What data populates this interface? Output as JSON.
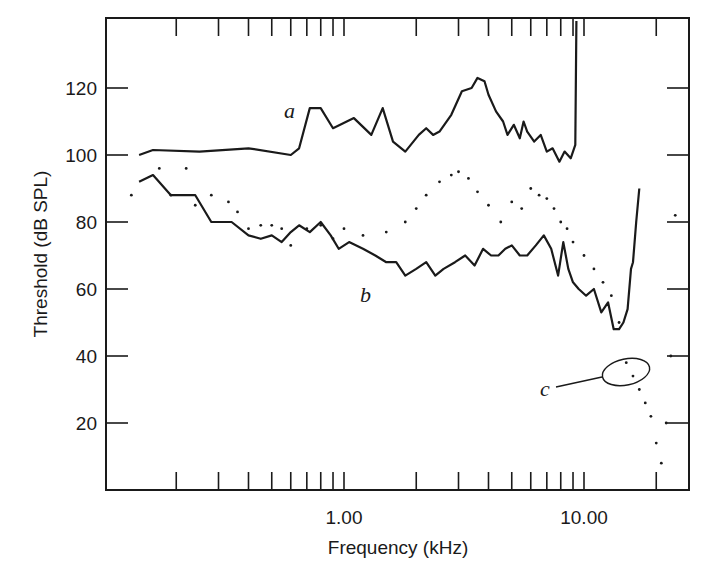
{
  "chart_data": {
    "type": "line",
    "title": "",
    "xlabel": "Frequency (kHz)",
    "ylabel": "Threshold (dB SPL)",
    "xscale": "log",
    "xlim": [
      0.12,
      28
    ],
    "ylim": [
      0,
      141
    ],
    "grid": false,
    "legend": "none (inline curve labels a, b, c)",
    "x_tick_labels": [
      {
        "value": 1.0,
        "label": "1.00"
      },
      {
        "value": 10.0,
        "label": "10.00"
      }
    ],
    "x_minor_ticks": [
      0.2,
      0.3,
      0.4,
      0.5,
      0.6,
      0.7,
      0.8,
      0.9,
      1.0,
      2,
      3,
      4,
      5,
      6,
      7,
      8,
      9,
      10,
      20
    ],
    "y_ticks": [
      20,
      40,
      60,
      80,
      100,
      120
    ],
    "y_tick_labels": [
      "20",
      "40",
      "60",
      "80",
      "100",
      "120"
    ],
    "annotations": [
      {
        "text": "a",
        "x": 0.6,
        "y": 112,
        "target": "series a (upper solid curve)"
      },
      {
        "text": "b",
        "x": 1.9,
        "y": 60,
        "target": "series b (lower solid curve)"
      },
      {
        "text": "c",
        "x": 11.5,
        "y": 28,
        "target": "dotted cluster, circled region near 15 kHz / 35 dB"
      }
    ],
    "series": [
      {
        "name": "a",
        "style": "solid",
        "x": [
          0.14,
          0.16,
          0.25,
          0.4,
          0.6,
          0.65,
          0.72,
          0.8,
          0.9,
          1.1,
          1.3,
          1.45,
          1.6,
          1.8,
          2.05,
          2.2,
          2.35,
          2.5,
          2.8,
          3.1,
          3.4,
          3.6,
          3.85,
          4.0,
          4.3,
          4.6,
          4.8,
          5.1,
          5.4,
          5.6,
          5.8,
          6.2,
          6.6,
          7.0,
          7.4,
          7.9,
          8.3,
          8.8,
          9.2,
          9.3,
          9.3
        ],
        "y": [
          100,
          101.5,
          101,
          102,
          100,
          102,
          114,
          114,
          108,
          111,
          106,
          114,
          104,
          101,
          106,
          108,
          106,
          107,
          112,
          119,
          120,
          123,
          122,
          118,
          113,
          110,
          106,
          109,
          105,
          110,
          107,
          104,
          106,
          101,
          102,
          98,
          101,
          99,
          103,
          140,
          140
        ]
      },
      {
        "name": "b",
        "style": "solid",
        "x": [
          0.14,
          0.16,
          0.19,
          0.24,
          0.28,
          0.34,
          0.4,
          0.45,
          0.5,
          0.55,
          0.6,
          0.65,
          0.72,
          0.8,
          0.88,
          0.95,
          1.05,
          1.2,
          1.35,
          1.5,
          1.65,
          1.8,
          2.0,
          2.2,
          2.4,
          2.6,
          2.9,
          3.2,
          3.5,
          3.8,
          4.1,
          4.4,
          4.7,
          5.0,
          5.4,
          5.8,
          6.3,
          6.8,
          7.3,
          7.8,
          8.2,
          8.6,
          9.0,
          9.5,
          10.2,
          11.0,
          11.8,
          12.6,
          13.3,
          14.0,
          14.6,
          15.2,
          15.7,
          16.0,
          16.5,
          17.0
        ],
        "y": [
          92,
          94,
          88,
          88,
          80,
          80,
          76,
          75,
          76,
          74,
          77,
          79,
          77,
          80,
          76,
          72,
          74,
          72,
          70,
          68,
          68,
          64,
          66,
          68,
          64,
          66,
          68,
          70,
          67,
          72,
          70,
          70,
          72,
          73,
          70,
          70,
          73,
          76,
          72,
          64,
          74,
          66,
          62,
          60,
          58,
          60,
          53,
          56,
          48,
          48,
          50,
          54,
          66,
          68,
          80,
          90
        ]
      },
      {
        "name": "c (dotted scatter)",
        "style": "dots",
        "x": [
          0.13,
          0.17,
          0.19,
          0.22,
          0.24,
          0.28,
          0.33,
          0.36,
          0.4,
          0.45,
          0.5,
          0.55,
          0.6,
          0.7,
          0.8,
          0.9,
          1.0,
          1.2,
          1.5,
          1.8,
          2.0,
          2.2,
          2.5,
          2.8,
          3.0,
          3.3,
          3.6,
          4.0,
          4.5,
          5.0,
          5.5,
          6.0,
          6.5,
          7.0,
          7.5,
          8.0,
          8.5,
          9.0,
          10.0,
          11.0,
          12.0,
          13.0,
          14.0,
          15.0,
          16.0,
          17.0,
          18.0,
          19.0,
          20.0,
          21.0,
          22.0,
          23.0,
          24.0
        ],
        "y": [
          88,
          96,
          88,
          96,
          85,
          88,
          86,
          83,
          78,
          79,
          79,
          78,
          73,
          78,
          79,
          75,
          78,
          76,
          77,
          80,
          84,
          88,
          92,
          94,
          95,
          93,
          89,
          85,
          80,
          86,
          84,
          90,
          88,
          87,
          84,
          80,
          78,
          74,
          70,
          66,
          62,
          58,
          50,
          38,
          34,
          30,
          26,
          22,
          14,
          8,
          20,
          40,
          82
        ]
      }
    ]
  }
}
